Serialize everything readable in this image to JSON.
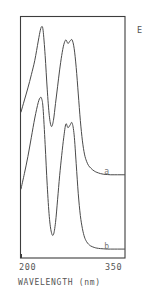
{
  "figure": {
    "background_color": "#ffffff",
    "line_color": "#4a4a4a",
    "frame_color": "#3d3d3d"
  },
  "axes": {
    "x_title": "WAVELENGTH (nm)",
    "x_tick_min": "200",
    "x_tick_max": "350",
    "y_title": "E"
  },
  "annotations": {
    "curve_a_label": "a",
    "curve_b_label": "b"
  },
  "chart_data": {
    "type": "line",
    "title": "",
    "subtitle": "",
    "xlabel": "WAVELENGTH (nm)",
    "ylabel": "E",
    "xlim": [
      200,
      350
    ],
    "ylim": [
      0,
      1
    ],
    "xticks": [
      200,
      350
    ],
    "xticklabels": [
      "200",
      "350"
    ],
    "yticks": [],
    "yticklabels": [],
    "grid": false,
    "legend": "inline-curve-labels",
    "legend_position": "right-inline",
    "annotations": [
      {
        "text": "a",
        "x": 325,
        "y": 0.355
      },
      {
        "text": "b",
        "x": 325,
        "y": 0.045
      }
    ],
    "series": [
      {
        "name": "a",
        "label": "a",
        "x": [
          200,
          205,
          210,
          215,
          220,
          225,
          228,
          230,
          232,
          235,
          238,
          241,
          244,
          247,
          250,
          253,
          256,
          259,
          262,
          265,
          268,
          271,
          274,
          277,
          280,
          283,
          286,
          289,
          292,
          295,
          298,
          301,
          304,
          307,
          310,
          315,
          320,
          325,
          330,
          335,
          340,
          345,
          350
        ],
        "y": [
          0.605,
          0.655,
          0.705,
          0.76,
          0.82,
          0.9,
          0.945,
          0.96,
          0.945,
          0.84,
          0.7,
          0.59,
          0.545,
          0.57,
          0.64,
          0.71,
          0.78,
          0.84,
          0.885,
          0.905,
          0.89,
          0.9,
          0.905,
          0.87,
          0.79,
          0.68,
          0.57,
          0.485,
          0.43,
          0.4,
          0.382,
          0.372,
          0.364,
          0.358,
          0.354,
          0.349,
          0.346,
          0.345,
          0.344,
          0.344,
          0.344,
          0.344,
          0.344
        ]
      },
      {
        "name": "b",
        "label": "b",
        "x": [
          200,
          205,
          210,
          215,
          220,
          225,
          228,
          230,
          232,
          235,
          238,
          241,
          244,
          247,
          250,
          253,
          256,
          259,
          262,
          265,
          268,
          271,
          274,
          277,
          280,
          283,
          286,
          289,
          292,
          295,
          298,
          301,
          304,
          307,
          310,
          315,
          320,
          325,
          330,
          335,
          340,
          345,
          350
        ],
        "y": [
          0.285,
          0.35,
          0.42,
          0.5,
          0.58,
          0.645,
          0.665,
          0.66,
          0.62,
          0.47,
          0.3,
          0.17,
          0.105,
          0.095,
          0.145,
          0.24,
          0.34,
          0.425,
          0.5,
          0.555,
          0.54,
          0.55,
          0.56,
          0.51,
          0.39,
          0.265,
          0.175,
          0.12,
          0.085,
          0.066,
          0.055,
          0.048,
          0.044,
          0.041,
          0.039,
          0.037,
          0.036,
          0.035,
          0.035,
          0.035,
          0.035,
          0.035,
          0.035
        ]
      }
    ]
  }
}
